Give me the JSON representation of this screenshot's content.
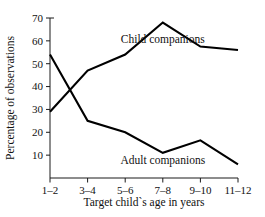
{
  "chart_data": {
    "type": "line",
    "title": "",
    "xlabel": "Target child`s age in years",
    "ylabel": "Percentage of observations",
    "categories": [
      "1–2",
      "3–4",
      "5–6",
      "7–8",
      "9–10",
      "11–12"
    ],
    "ylim": [
      0,
      70
    ],
    "yticks": [
      10,
      20,
      30,
      40,
      50,
      60,
      70
    ],
    "ytick_labels": [
      "10",
      "20",
      "30",
      "40",
      "50",
      "60",
      "70"
    ],
    "grid": false,
    "legend_position": "inline-annotation",
    "series": [
      {
        "name": "Child companions",
        "label": "Child companions",
        "values": [
          29,
          47,
          54,
          68,
          57.5,
          56
        ],
        "color": "#000000"
      },
      {
        "name": "Adult companions",
        "label": "Adult companions",
        "values": [
          54,
          25,
          20,
          11,
          16.5,
          6
        ],
        "color": "#000000"
      }
    ],
    "annotations": [
      {
        "text": "Child companions",
        "x_category": "7–8",
        "value": 59
      },
      {
        "text": "Adult companions",
        "x_category": "7–8",
        "value": 6
      }
    ]
  }
}
